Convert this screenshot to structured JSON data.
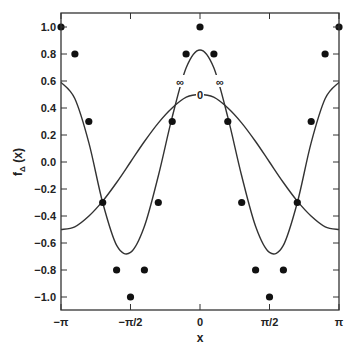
{
  "chart_data": {
    "type": "line",
    "title": "",
    "xlabel": "x",
    "ylabel": "f_Δ(x)",
    "xlim": [
      -3.14159,
      3.14159
    ],
    "ylim": [
      -1.1,
      1.1
    ],
    "grid": false,
    "x_ticks": [
      {
        "value": -3.14159,
        "label": "−π"
      },
      {
        "value": -1.5708,
        "label": "−π/2"
      },
      {
        "value": 0,
        "label": "0"
      },
      {
        "value": 1.5708,
        "label": "π/2"
      },
      {
        "value": 3.14159,
        "label": "π"
      }
    ],
    "y_ticks": [
      {
        "value": 1.0,
        "label": "1.0"
      },
      {
        "value": 0.8,
        "label": "0.8"
      },
      {
        "value": 0.6,
        "label": "0.6"
      },
      {
        "value": 0.4,
        "label": "0.4"
      },
      {
        "value": 0.2,
        "label": "0.2"
      },
      {
        "value": 0.0,
        "label": "0.0"
      },
      {
        "value": -0.2,
        "label": "−0.2"
      },
      {
        "value": -0.4,
        "label": "−0.4"
      },
      {
        "value": -0.6,
        "label": "−0.6"
      },
      {
        "value": -0.8,
        "label": "−0.8"
      },
      {
        "value": -1.0,
        "label": "−1.0"
      }
    ],
    "sample_points": {
      "name": "samples",
      "marker": "filled-circle",
      "x_multiples_of_pi_over_10": [
        -10,
        -9,
        -8,
        -7,
        -6,
        -5,
        -4,
        -3,
        -2,
        -1,
        0,
        1,
        2,
        3,
        4,
        5,
        6,
        7,
        8,
        9,
        10
      ],
      "y": [
        1.0,
        0.8,
        0.3,
        -0.3,
        -0.8,
        -1.0,
        -0.8,
        -0.3,
        0.3,
        0.8,
        1.0,
        0.8,
        0.3,
        -0.3,
        -0.8,
        -1.0,
        -0.8,
        -0.3,
        0.3,
        0.8,
        1.0
      ]
    },
    "series": [
      {
        "name": "0",
        "label": "0",
        "label_position": {
          "x": 0.0,
          "y": 0.5
        },
        "x": [
          -3.14,
          -2.83,
          -2.51,
          -2.2,
          -1.88,
          -1.57,
          -1.26,
          -0.94,
          -0.63,
          -0.31,
          0,
          0.31,
          0.63,
          0.94,
          1.26,
          1.57,
          1.88,
          2.2,
          2.51,
          2.83,
          3.14
        ],
        "values": [
          -0.5,
          -0.48,
          -0.4,
          -0.29,
          -0.15,
          0.0,
          0.15,
          0.29,
          0.4,
          0.48,
          0.5,
          0.48,
          0.4,
          0.29,
          0.15,
          0.0,
          -0.15,
          -0.29,
          -0.4,
          -0.48,
          -0.5
        ]
      },
      {
        "name": "∞",
        "label": "∞",
        "label_positions": [
          {
            "x": -0.45,
            "y": 0.6
          },
          {
            "x": 0.45,
            "y": 0.6
          }
        ],
        "x": [
          -3.14,
          -2.83,
          -2.51,
          -2.2,
          -1.88,
          -1.57,
          -1.26,
          -0.94,
          -0.63,
          -0.31,
          0,
          0.31,
          0.63,
          0.94,
          1.26,
          1.57,
          1.88,
          2.2,
          2.51,
          2.83,
          3.14
        ],
        "values": [
          0.59,
          0.47,
          0.14,
          -0.3,
          -0.62,
          -0.67,
          -0.48,
          -0.1,
          0.33,
          0.7,
          0.83,
          0.7,
          0.33,
          -0.1,
          -0.48,
          -0.67,
          -0.62,
          -0.3,
          0.14,
          0.47,
          0.59
        ]
      }
    ]
  }
}
